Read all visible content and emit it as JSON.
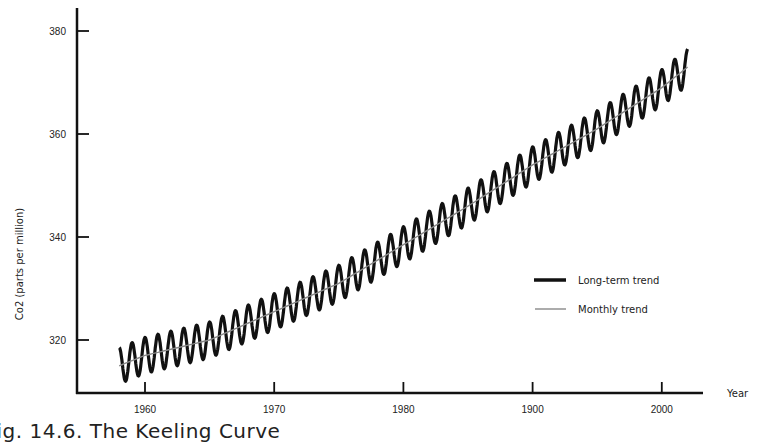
{
  "caption": "Fig. 14.6. The Keeling Curve",
  "chart_data": {
    "type": "line",
    "title": "The Keeling Curve",
    "xlabel": "Year",
    "ylabel": "Co2 (parts per million)",
    "xlim": [
      1955.5,
      2005
    ],
    "ylim": [
      310,
      384
    ],
    "x_ticks": [
      1960,
      1970,
      1980,
      1990,
      2000
    ],
    "x_tick_labels": [
      "1960",
      "1970",
      "1980",
      "1900",
      "2000"
    ],
    "y_ticks": [
      320,
      340,
      360,
      380
    ],
    "y_tick_labels": [
      "320",
      "340",
      "360",
      "380"
    ],
    "grid": false,
    "legend_position": "right-center",
    "series": [
      {
        "name": "Long-term trend",
        "style": "thick",
        "description": "Seasonal oscillation of about ±3.5 ppm around the trend, drawn with a thick black stroke",
        "start_year": 1958,
        "end_year": 2002,
        "seasonal_amplitude": 3.5,
        "x": [
          1958,
          1960,
          1965,
          1970,
          1975,
          1980,
          1985,
          1990,
          1995,
          2000,
          2002
        ],
        "values": [
          315,
          317,
          320,
          325.5,
          331,
          338.5,
          346,
          354,
          361,
          369,
          373
        ]
      },
      {
        "name": "Monthly trend",
        "style": "thin",
        "description": "Smoothed annual-average line, thin gray stroke",
        "x": [
          1958,
          1960,
          1965,
          1970,
          1975,
          1980,
          1985,
          1990,
          1995,
          2000,
          2002
        ],
        "values": [
          315,
          317,
          320,
          325.5,
          331,
          338.5,
          346,
          354,
          361,
          369,
          373
        ]
      }
    ]
  },
  "legend": {
    "items": [
      {
        "label": "Long-term trend"
      },
      {
        "label": "Monthly trend"
      }
    ]
  },
  "colors": {
    "axis": "#111111",
    "long_term": "#111111",
    "monthly": "#777777",
    "text": "#222222"
  }
}
